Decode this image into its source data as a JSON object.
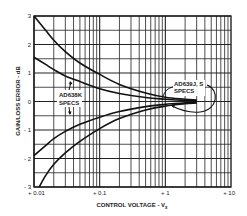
{
  "chart_data": {
    "type": "line",
    "title": "",
    "xlabel": "CONTROL VOLTAGE - Vx",
    "ylabel": "GAIN/LOSS ERROR - dB",
    "xscale": "log",
    "xlim": [
      0.01,
      10
    ],
    "ylim": [
      -3,
      3
    ],
    "grid": true,
    "x_ticks": [
      {
        "value": 0.01,
        "label": "+ 0.01"
      },
      {
        "value": 0.1,
        "label": "+ 0.1"
      },
      {
        "value": 1,
        "label": "+ 1"
      },
      {
        "value": 10,
        "label": "+ 10"
      }
    ],
    "y_ticks": [
      {
        "value": 3,
        "label": "3"
      },
      {
        "value": 2,
        "label": "2"
      },
      {
        "value": 1,
        "label": "1"
      },
      {
        "value": 0,
        "label": "0"
      },
      {
        "value": -1,
        "label": "- 1"
      },
      {
        "value": -2,
        "label": "- 2"
      },
      {
        "value": -3,
        "label": "- 3"
      }
    ],
    "series": [
      {
        "name": "AD638K upper limit",
        "x": [
          0.01,
          0.015,
          0.02,
          0.03,
          0.05,
          0.1,
          0.2,
          0.5,
          1,
          2,
          3
        ],
        "y": [
          3.0,
          2.5,
          2.15,
          1.75,
          1.35,
          0.95,
          0.6,
          0.3,
          0.15,
          0.08,
          0.05
        ]
      },
      {
        "name": "AD639J,S upper limit",
        "x": [
          0.01,
          0.015,
          0.02,
          0.03,
          0.05,
          0.1,
          0.2,
          0.5,
          1,
          2,
          3
        ],
        "y": [
          1.55,
          1.3,
          1.12,
          0.9,
          0.7,
          0.45,
          0.28,
          0.14,
          0.08,
          0.04,
          0.03
        ]
      },
      {
        "name": "AD639J,S lower limit",
        "x": [
          0.01,
          0.015,
          0.02,
          0.03,
          0.05,
          0.1,
          0.2,
          0.5,
          1,
          2,
          3
        ],
        "y": [
          -1.9,
          -1.55,
          -1.3,
          -1.05,
          -0.8,
          -0.55,
          -0.35,
          -0.18,
          -0.1,
          -0.05,
          -0.03
        ]
      },
      {
        "name": "AD638K lower limit",
        "x": [
          0.012,
          0.015,
          0.02,
          0.03,
          0.05,
          0.1,
          0.2,
          0.5,
          1,
          2,
          3
        ],
        "y": [
          -3.0,
          -2.6,
          -2.2,
          -1.8,
          -1.4,
          -0.95,
          -0.6,
          -0.3,
          -0.16,
          -0.08,
          -0.05
        ]
      }
    ],
    "annotations": [
      {
        "text_lines": [
          "AD638K",
          "SPECS"
        ],
        "target": "outer curves"
      },
      {
        "text_lines": [
          "AD639J, S",
          "SPECS"
        ],
        "target": "inner curves"
      }
    ]
  },
  "labels": {
    "ylabel": "GAIN/LOSS ERROR - dB",
    "xlabel_main": "CONTROL VOLTAGE - V",
    "xlabel_sub": "x",
    "annot1_line1": "AD638K",
    "annot1_line2": "SPECS",
    "annot2_line1": "AD639J, S",
    "annot2_line2": "SPECS"
  }
}
